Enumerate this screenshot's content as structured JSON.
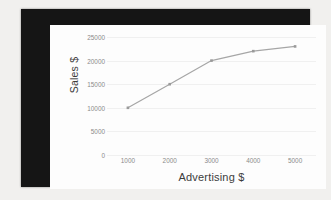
{
  "chart_data": {
    "type": "line",
    "title": "",
    "subtitle": "",
    "xlabel": "Advertising $",
    "ylabel": "Sales $",
    "x": [
      1000,
      2000,
      3000,
      4000,
      5000
    ],
    "xtick_labels": [
      "1000",
      "2000",
      "3000",
      "4000",
      "5000"
    ],
    "ytick_labels": [
      "25000",
      "20000",
      "15000",
      "10000",
      "5000",
      "0"
    ],
    "ytick_values": [
      25000,
      20000,
      15000,
      10000,
      5000,
      0
    ],
    "ylim": [
      0,
      25000
    ],
    "xlim": [
      500,
      5500
    ],
    "grid": "horizontal",
    "legend": "none",
    "series": [
      {
        "name": "Sales",
        "values": [
          10000,
          15000,
          20000,
          22000,
          23000
        ],
        "line_color": "#a6a6a6",
        "marker": "square",
        "marker_color": "#9a9a9a"
      }
    ],
    "annotations": []
  },
  "style": {
    "plot_background": "#fdfdfd",
    "frame_color": "#151515",
    "page_background": "#f1f0ee",
    "gridline_color": "#f0f0f0",
    "tick_label_color": "#8a8a8a",
    "axis_title_color": "#3c3c3c"
  }
}
